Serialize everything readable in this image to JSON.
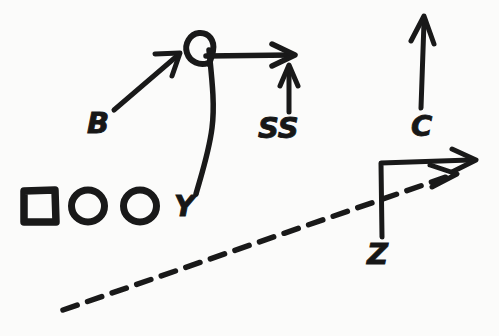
{
  "diagram": {
    "background_color": "#fbfbfa",
    "ink_color": "#191919",
    "labels": {
      "b": "B",
      "ss": "SS",
      "c": "C",
      "y": "Y",
      "z": "Z"
    },
    "elements": {
      "square_label": "square-player-marker",
      "circle_one_label": "circle-player-marker-1",
      "circle_two_label": "circle-player-marker-2",
      "loop_label": "looping-route-top",
      "b_arrow_label": "b-diagonal-route-arrow",
      "top_horizontal_arrow_label": "horizontal-route-arrow",
      "ss_arrow_label": "ss-vertical-arrow",
      "c_arrow_label": "c-vertical-arrow",
      "z_route_label": "z-vertical-then-horizontal-arrow",
      "dashed_route_label": "dashed-diagonal-route-arrow",
      "y_route_label": "y-curving-vertical-route"
    },
    "counts": {
      "markers": 3,
      "arrows": 6,
      "labels": 5
    }
  }
}
